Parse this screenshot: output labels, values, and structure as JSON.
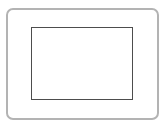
{
  "diagram": {
    "type": "nested-frames",
    "outer_frame": {
      "shape": "rounded-rectangle",
      "stroke_color": "#b3b3b3"
    },
    "inner_rect": {
      "shape": "rectangle",
      "stroke_color": "#4d4d4d"
    },
    "background_color": "#ffffff"
  }
}
